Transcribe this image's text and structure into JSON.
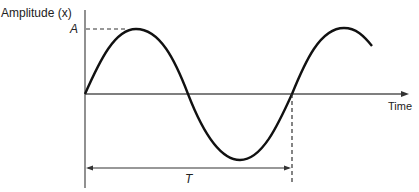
{
  "diagram": {
    "type": "sine-wave",
    "labels": {
      "y_axis": "Amplitude (x)",
      "x_axis": "Time",
      "amplitude": "A",
      "period": "T"
    },
    "colors": {
      "curve": "#111111",
      "axis": "#555555",
      "dashed": "#333333"
    }
  }
}
